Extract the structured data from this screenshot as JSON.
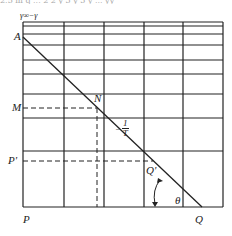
{
  "header": {
    "cropped_text": "2.5 m q ... 2 2 y 3 y 3 y ... yy"
  },
  "diagram": {
    "axis_label_y": "γ∞−γ",
    "labels": {
      "A": "A",
      "M": "M",
      "N": "N",
      "P_prime": "P'",
      "Q_prime": "Q'",
      "P": "P",
      "Q": "Q",
      "theta": "θ",
      "slope_sign": "−",
      "slope_num": "1",
      "slope_den": "T"
    },
    "grid": {
      "vertical_lines_x": [
        23,
        64,
        104,
        144,
        183,
        223
      ],
      "horizontal_lines_y": [
        22,
        26,
        34,
        45,
        60,
        74,
        94,
        118,
        151,
        207
      ]
    },
    "line_color": "#222222"
  }
}
